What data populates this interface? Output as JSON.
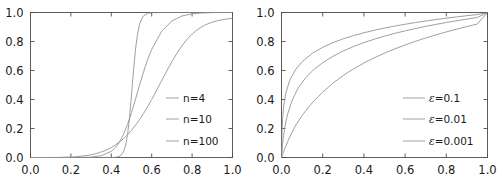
{
  "figure": {
    "background_color": "#ffffff",
    "axis_color": "#4d4d4d",
    "text_color": "#1a1a1a",
    "panel_count": 2
  },
  "chart_data": [
    {
      "type": "line",
      "title": "",
      "xlabel": "",
      "ylabel": "",
      "xlim": [
        0.0,
        1.0
      ],
      "ylim": [
        0.0,
        1.0
      ],
      "grid": false,
      "legend_position": "center-right",
      "xticks": [
        0.0,
        0.2,
        0.4,
        0.6,
        0.8,
        1.0
      ],
      "yticks": [
        0.0,
        0.2,
        0.4,
        0.6,
        0.8,
        1.0
      ],
      "xticklabels": [
        "0.0",
        "0.2",
        "0.4",
        "0.6",
        "0.8",
        "1.0"
      ],
      "yticklabels": [
        "0.0",
        "0.2",
        "0.4",
        "0.6",
        "0.8",
        "1.0"
      ],
      "series": [
        {
          "name": "n=4",
          "label": "n=4",
          "color": "#9a9a9a",
          "x": [
            0.0,
            0.02,
            0.04,
            0.06,
            0.08,
            0.1,
            0.12,
            0.14,
            0.16,
            0.18,
            0.2,
            0.22,
            0.24,
            0.26,
            0.28,
            0.3,
            0.32,
            0.34,
            0.36,
            0.38,
            0.4,
            0.42,
            0.44,
            0.46,
            0.48,
            0.5,
            0.52,
            0.54,
            0.56,
            0.58,
            0.6,
            0.62,
            0.64,
            0.66,
            0.68,
            0.7,
            0.72,
            0.74,
            0.76,
            0.78,
            0.8,
            0.82,
            0.84,
            0.86,
            0.88,
            0.9,
            0.92,
            0.94,
            0.96,
            0.98,
            1.0
          ],
          "y": [
            0.0,
            0.0,
            0.0,
            0.0,
            0.0001,
            0.0002,
            0.0004,
            0.0007,
            0.0013,
            0.0021,
            0.0033,
            0.005,
            0.0072,
            0.0102,
            0.0141,
            0.019,
            0.0253,
            0.0332,
            0.0429,
            0.0547,
            0.0689,
            0.0859,
            0.106,
            0.1294,
            0.1565,
            0.1875,
            0.2225,
            0.2615,
            0.3043,
            0.3506,
            0.4,
            0.4516,
            0.5047,
            0.558,
            0.6105,
            0.6608,
            0.7079,
            0.7509,
            0.7892,
            0.8227,
            0.8512,
            0.8751,
            0.8947,
            0.9106,
            0.9233,
            0.9334,
            0.9414,
            0.9477,
            0.9527,
            0.9566,
            0.9597
          ],
          "note": "y = x^n/(x^n+(1-x)^n) with n=4"
        },
        {
          "name": "n=10",
          "label": "n=10",
          "color": "#9a9a9a",
          "x": [
            0.0,
            0.05,
            0.1,
            0.15,
            0.2,
            0.25,
            0.3,
            0.35,
            0.4,
            0.42,
            0.44,
            0.46,
            0.48,
            0.5,
            0.52,
            0.54,
            0.56,
            0.58,
            0.6,
            0.65,
            0.7,
            0.75,
            0.8,
            0.85,
            0.9,
            0.95,
            1.0
          ],
          "y": [
            0.0,
            0.0,
            0.0,
            0.0,
            0.0001,
            0.0005,
            0.0028,
            0.0122,
            0.0424,
            0.0682,
            0.1062,
            0.1587,
            0.2269,
            0.3096,
            0.4031,
            0.5,
            0.5926,
            0.6756,
            0.7455,
            0.8721,
            0.9415,
            0.9759,
            0.9908,
            0.997,
            0.9992,
            0.9999,
            1.0
          ],
          "note": "y = x^n/(x^n+(1-x)^n) with n=10"
        },
        {
          "name": "n=100",
          "label": "n=100",
          "color": "#9a9a9a",
          "x": [
            0.0,
            0.1,
            0.2,
            0.3,
            0.35,
            0.4,
            0.42,
            0.44,
            0.45,
            0.46,
            0.47,
            0.48,
            0.49,
            0.5,
            0.51,
            0.52,
            0.53,
            0.54,
            0.55,
            0.56,
            0.58,
            0.6,
            0.65,
            0.7,
            0.8,
            0.9,
            1.0
          ],
          "y": [
            0.0,
            0.0,
            0.0,
            0.0,
            0.0,
            0.0,
            0.0003,
            0.0082,
            0.0181,
            0.0383,
            0.0785,
            0.1524,
            0.2689,
            0.4323,
            0.6,
            0.7469,
            0.8524,
            0.9183,
            0.9564,
            0.9772,
            0.9943,
            0.9988,
            1.0,
            1.0,
            1.0,
            1.0,
            1.0
          ],
          "note": "y = x^n/(x^n+(1-x)^n) with n=100"
        }
      ]
    },
    {
      "type": "line",
      "title": "",
      "xlabel": "",
      "ylabel": "",
      "xlim": [
        0.0,
        1.0
      ],
      "ylim": [
        0.0,
        1.0
      ],
      "grid": false,
      "legend_position": "center-right",
      "xticks": [
        0.0,
        0.2,
        0.4,
        0.6,
        0.8,
        1.0
      ],
      "yticks": [
        0.0,
        0.2,
        0.4,
        0.6,
        0.8,
        1.0
      ],
      "xticklabels": [
        "0.0",
        "0.2",
        "0.4",
        "0.6",
        "0.8",
        "1.0"
      ],
      "yticklabels": [
        "0.0",
        "0.2",
        "0.4",
        "0.6",
        "0.8",
        "1.0"
      ],
      "series": [
        {
          "name": "eps=0.1",
          "label": "ε=0.1",
          "label_symbol": "ε",
          "label_value": "0.1",
          "color": "#9a9a9a",
          "x": [
            0.0,
            0.01,
            0.02,
            0.03,
            0.05,
            0.07,
            0.1,
            0.13,
            0.16,
            0.2,
            0.25,
            0.3,
            0.35,
            0.4,
            0.45,
            0.5,
            0.55,
            0.6,
            0.65,
            0.7,
            0.75,
            0.8,
            0.85,
            0.9,
            0.95,
            1.0
          ],
          "y": [
            0.0,
            0.0396,
            0.0761,
            0.1098,
            0.1708,
            0.2241,
            0.2894,
            0.3452,
            0.3939,
            0.4506,
            0.5132,
            0.5659,
            0.6115,
            0.6516,
            0.6874,
            0.7197,
            0.7491,
            0.7761,
            0.8011,
            0.8243,
            0.8459,
            0.8661,
            0.8852,
            0.9031,
            0.9201,
            1.0
          ],
          "note": "y = ln(1+x/eps)/ln(1+1/eps), eps=0.1"
        },
        {
          "name": "eps=0.01",
          "label": "ε=0.01",
          "label_symbol": "ε",
          "label_value": "0.01",
          "color": "#9a9a9a",
          "x": [
            0.0,
            0.005,
            0.01,
            0.02,
            0.03,
            0.05,
            0.08,
            0.12,
            0.16,
            0.2,
            0.25,
            0.3,
            0.35,
            0.4,
            0.45,
            0.5,
            0.55,
            0.6,
            0.65,
            0.7,
            0.75,
            0.8,
            0.85,
            0.9,
            0.95,
            1.0
          ],
          "y": [
            0.0,
            0.0879,
            0.1504,
            0.2381,
            0.3004,
            0.3884,
            0.4777,
            0.5552,
            0.6106,
            0.6536,
            0.6983,
            0.7348,
            0.7656,
            0.7923,
            0.8158,
            0.8368,
            0.8559,
            0.8733,
            0.8893,
            0.9042,
            0.918,
            0.9309,
            0.9431,
            0.9546,
            0.9655,
            1.0
          ],
          "note": "y = ln(1+x/eps)/ln(1+1/eps), eps=0.01"
        },
        {
          "name": "eps=0.001",
          "label": "ε=0.001",
          "label_symbol": "ε",
          "label_value": "0.001",
          "color": "#9a9a9a",
          "x": [
            0.0,
            0.002,
            0.005,
            0.01,
            0.02,
            0.04,
            0.07,
            0.1,
            0.15,
            0.2,
            0.25,
            0.3,
            0.35,
            0.4,
            0.45,
            0.5,
            0.55,
            0.6,
            0.65,
            0.7,
            0.75,
            0.8,
            0.85,
            0.9,
            0.95,
            1.0
          ],
          "y": [
            0.0,
            0.1591,
            0.2595,
            0.3473,
            0.4391,
            0.5327,
            0.6094,
            0.6604,
            0.7187,
            0.7601,
            0.7923,
            0.8187,
            0.841,
            0.8603,
            0.8774,
            0.8927,
            0.9065,
            0.9191,
            0.9307,
            0.9414,
            0.9514,
            0.9608,
            0.9696,
            0.9779,
            0.9858,
            1.0
          ],
          "note": "y = ln(1+x/eps)/ln(1+1/eps), eps=0.001"
        }
      ]
    }
  ]
}
